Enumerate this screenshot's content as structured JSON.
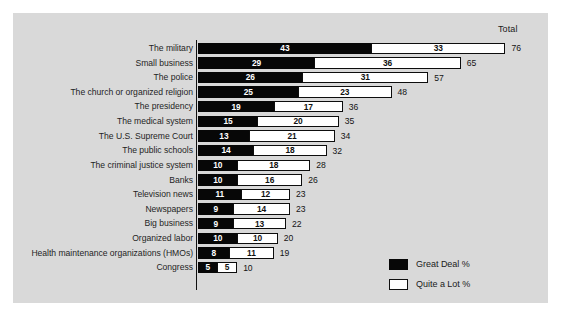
{
  "chart_data": {
    "type": "bar",
    "orientation": "horizontal",
    "stacked": true,
    "title": "",
    "subtitle": "",
    "xlabel": "",
    "ylabel": "",
    "total_header": "Total",
    "xlim": [
      0,
      76
    ],
    "grid": false,
    "legend_position": "bottom-right",
    "legend": [
      {
        "name": "Great Deal %",
        "color": "#070707"
      },
      {
        "name": "Quite a Lot %",
        "color": "#ffffff"
      }
    ],
    "categories": [
      "The military",
      "Small business",
      "The police",
      "The church or organized religion",
      "The presidency",
      "The medical system",
      "The U.S. Supreme Court",
      "The public schools",
      "The criminal justice system",
      "Banks",
      "Television news",
      "Newspapers",
      "Big business",
      "Organized labor",
      "Health maintenance organizations (HMOs)",
      "Congress"
    ],
    "series": [
      {
        "name": "Great Deal %",
        "values": [
          43,
          29,
          26,
          25,
          19,
          15,
          13,
          14,
          10,
          10,
          11,
          9,
          9,
          10,
          8,
          5
        ]
      },
      {
        "name": "Quite a Lot %",
        "values": [
          33,
          36,
          31,
          23,
          17,
          20,
          21,
          18,
          18,
          16,
          12,
          14,
          13,
          10,
          11,
          5
        ]
      }
    ],
    "totals": [
      76,
      65,
      57,
      48,
      36,
      35,
      34,
      32,
      28,
      26,
      23,
      23,
      22,
      20,
      19,
      10
    ]
  },
  "colors": {
    "background": "#ffffff",
    "panel": "#d9d9d9",
    "great_deal": "#070707",
    "quite_a_lot": "#ffffff",
    "axis": "#111111",
    "text": "#1a1a1a"
  }
}
